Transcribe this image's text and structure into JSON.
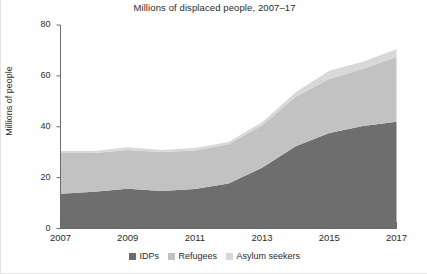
{
  "chart_data": {
    "type": "area",
    "title": "Millions of displaced people, 2007–17",
    "xlabel": "",
    "ylabel": "Millions of people",
    "x": [
      2007,
      2008,
      2009,
      2010,
      2011,
      2012,
      2013,
      2014,
      2015,
      2016,
      2017
    ],
    "xlim": [
      2007,
      2017
    ],
    "ylim": [
      0,
      80
    ],
    "yticks": [
      0,
      20,
      40,
      60,
      80
    ],
    "ytick_labels": [
      "0",
      "20",
      "40",
      "60",
      "80"
    ],
    "xticks": [
      2007,
      2009,
      2011,
      2013,
      2015,
      2017
    ],
    "xtick_labels": [
      "2007",
      "2009",
      "2011",
      "2013",
      "2015",
      "2017"
    ],
    "grid": false,
    "stacked": true,
    "legend_position": "bottom",
    "series": [
      {
        "name": "IDPs",
        "color": "#6e6e6e",
        "values": [
          13.7,
          14.4,
          15.6,
          14.7,
          15.5,
          17.7,
          23.9,
          32.3,
          37.5,
          40.3,
          42.0
        ]
      },
      {
        "name": "Refugees",
        "color": "#c2c2c2",
        "values": [
          16.0,
          15.3,
          15.3,
          15.4,
          15.2,
          15.4,
          16.7,
          19.5,
          21.3,
          22.5,
          25.4
        ]
      },
      {
        "name": "Asylum seekers",
        "color": "#d8d8d8",
        "values": [
          0.8,
          0.8,
          1.0,
          0.8,
          0.9,
          0.9,
          1.2,
          1.8,
          3.2,
          2.8,
          3.1
        ]
      }
    ],
    "totals": [
      30.5,
      30.5,
      31.9,
      30.9,
      31.6,
      34.0,
      41.8,
      53.6,
      62.0,
      65.6,
      70.5
    ]
  },
  "legend": {
    "entries": [
      {
        "label": "IDPs",
        "color": "#6e6e6e"
      },
      {
        "label": "Refugees",
        "color": "#c2c2c2"
      },
      {
        "label": "Asylum seekers",
        "color": "#d8d8d8"
      }
    ]
  }
}
